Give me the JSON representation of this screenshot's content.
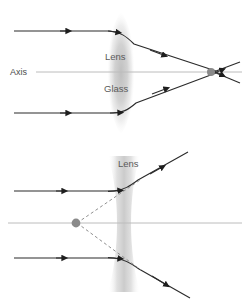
{
  "figure": {
    "background_color": "#ffffff",
    "ray_color": "#2b2b2b",
    "axis_color": "#b9b9b9",
    "lens_fill_color": "#c9c9c9",
    "focal_dot_color": "#8a8a8a",
    "dashed_color": "#8f8f8f",
    "label_color": "#5a5a5a"
  },
  "panels": [
    {
      "id": "converging-lens-panel",
      "lens_type": "biconvex",
      "labels": {
        "axis": "Axis",
        "lens": "Lens",
        "glass": "Glass"
      },
      "rays": {
        "incoming_count": 2,
        "behavior": "converge",
        "focal_point": "real"
      }
    },
    {
      "id": "diverging-lens-panel",
      "lens_type": "biconcave",
      "labels": {
        "lens": "Lens"
      },
      "rays": {
        "incoming_count": 2,
        "behavior": "diverge",
        "focal_point": "virtual"
      }
    }
  ]
}
